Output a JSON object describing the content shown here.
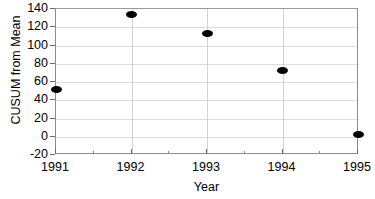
{
  "chart_data": {
    "type": "scatter",
    "title": "",
    "xlabel": "Year",
    "ylabel": "CUSUM from Mean",
    "x": [
      1991,
      1992,
      1993,
      1994,
      1995
    ],
    "values": [
      52,
      134,
      113,
      73,
      2
    ],
    "categories": [
      "1991",
      "1992",
      "1993",
      "1994",
      "1995"
    ],
    "xlim": [
      1991,
      1995
    ],
    "ylim": [
      -20,
      140
    ],
    "ytick_labels": [
      "140",
      "120",
      "100",
      "80",
      "60",
      "40",
      "20",
      "0",
      "-20"
    ],
    "ytick_values": [
      140,
      120,
      100,
      80,
      60,
      40,
      20,
      0,
      -20
    ],
    "xtick_labels": [
      "1991",
      "1992",
      "1993",
      "1994",
      "1995"
    ],
    "xtick_minor_count": 1,
    "grid": {
      "horizontal": true,
      "vertical": true,
      "color": "#dcdcdc"
    },
    "legend": null,
    "marker": {
      "shape": "ellipse",
      "color": "#000000"
    },
    "series": [
      {
        "name": "CUSUM from Mean",
        "points": [
          {
            "x": "1991",
            "y": 52
          },
          {
            "x": "1992",
            "y": 134
          },
          {
            "x": "1993",
            "y": 113
          },
          {
            "x": "1994",
            "y": 73
          },
          {
            "x": "1995",
            "y": 2
          }
        ]
      }
    ]
  },
  "colors": {
    "axis": "#8c8c8c",
    "grid": "#dcdcdc",
    "marker": "#000000",
    "text": "#000000",
    "background": "#ffffff"
  }
}
